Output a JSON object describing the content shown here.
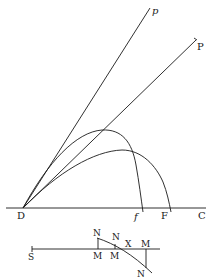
{
  "diagram": {
    "type": "geometric-figure",
    "upper_figure": {
      "lines": [
        {
          "from": "D",
          "to": "p"
        },
        {
          "from": "D",
          "to": "P"
        },
        {
          "from": "D",
          "to": "C",
          "role": "baseline"
        }
      ],
      "curves": [
        {
          "from": "D",
          "to": "f",
          "role": "upper-trajectory"
        },
        {
          "from": "D",
          "to": "F",
          "role": "lower-trajectory"
        }
      ],
      "labels": {
        "p": "p",
        "P": "P",
        "D": "D",
        "f": "f",
        "F": "F",
        "C": "C"
      }
    },
    "lower_figure": {
      "labels": {
        "S": "S",
        "N1": "N",
        "N2": "N",
        "N3": "N",
        "X": "X",
        "M1": "M",
        "M2": "M",
        "M3": "M"
      }
    }
  },
  "colors": {
    "ink": "#1a1a1a",
    "background": "#ffffff"
  }
}
